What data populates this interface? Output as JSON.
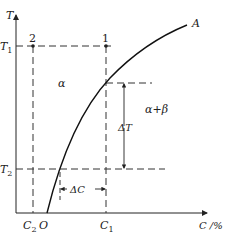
{
  "diagram": {
    "axes": {
      "y_label": "T",
      "x_label": "C /%",
      "origin_label": "O"
    },
    "y_ticks": [
      {
        "label": "T",
        "sub": "1"
      },
      {
        "label": "T",
        "sub": "2"
      }
    ],
    "x_ticks": [
      {
        "label": "C",
        "sub": "2"
      },
      {
        "label": "C",
        "sub": "1"
      }
    ],
    "points": [
      {
        "label": "2"
      },
      {
        "label": "1"
      }
    ],
    "curve_label": "A",
    "regions": {
      "alpha": "α",
      "alpha_beta": "α+β"
    },
    "annotations": {
      "delta_t": "ΔT",
      "delta_c": "ΔC"
    },
    "colors": {
      "line": "#222222",
      "background": "#ffffff"
    }
  }
}
